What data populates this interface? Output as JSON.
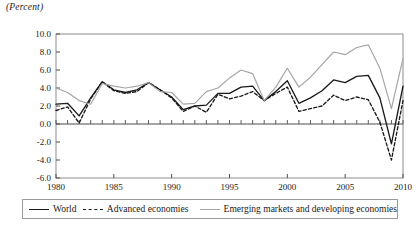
{
  "units_label": "(Percent)",
  "legend": {
    "entries": [
      {
        "label": "World",
        "style": "solid-dark",
        "color": "#1a1a1a"
      },
      {
        "label": "Advanced economies",
        "style": "dashed-dark",
        "color": "#1a1a1a"
      },
      {
        "label": "Emerging markets and developing economies",
        "style": "solid-gray",
        "color": "#a6a6a6"
      }
    ]
  },
  "chart_data": {
    "type": "line",
    "title": "",
    "subtitle": "",
    "xlabel": "",
    "ylabel": "(Percent)",
    "xlim": [
      1980,
      2010
    ],
    "ylim": [
      -6.0,
      10.0
    ],
    "yticks": [
      -6.0,
      -4.0,
      -2.0,
      0.0,
      2.0,
      4.0,
      6.0,
      8.0,
      10.0
    ],
    "ytick_labels": [
      "-6.0",
      "-4.0",
      "-2.0",
      "0.0",
      "2.0",
      "4.0",
      "6.0",
      "8.0",
      "10.0"
    ],
    "xticks": [
      1980,
      1985,
      1990,
      1995,
      2000,
      2005,
      2010
    ],
    "xtick_labels": [
      "1980",
      "1985",
      "1990",
      "1995",
      "2000",
      "2005",
      "2010"
    ],
    "minor_xticks_every": 1,
    "grid": false,
    "zero_line": true,
    "legend_position": "below",
    "x": [
      1980,
      1981,
      1982,
      1983,
      1984,
      1985,
      1986,
      1987,
      1988,
      1989,
      1990,
      1991,
      1992,
      1993,
      1994,
      1995,
      1996,
      1997,
      1998,
      1999,
      2000,
      2001,
      2002,
      2003,
      2004,
      2005,
      2006,
      2007,
      2008,
      2009,
      2010
    ],
    "series": [
      {
        "name": "World",
        "color": "#1a1a1a",
        "style": "solid",
        "values": [
          2.2,
          2.3,
          0.9,
          2.9,
          4.7,
          3.8,
          3.5,
          3.8,
          4.6,
          3.8,
          3.0,
          1.6,
          2.0,
          2.1,
          3.4,
          3.4,
          4.1,
          4.2,
          2.6,
          3.6,
          4.8,
          2.3,
          2.9,
          3.7,
          4.9,
          4.6,
          5.3,
          5.4,
          2.9,
          -2.2,
          4.2
        ]
      },
      {
        "name": "Advanced economies",
        "color": "#1a1a1a",
        "style": "dashed",
        "values": [
          1.5,
          1.9,
          0.1,
          2.8,
          4.7,
          3.7,
          3.4,
          3.6,
          4.6,
          3.8,
          2.9,
          1.4,
          2.0,
          1.3,
          3.3,
          2.8,
          3.1,
          3.6,
          2.6,
          3.4,
          4.1,
          1.4,
          1.7,
          2.0,
          3.2,
          2.6,
          3.0,
          2.7,
          0.2,
          -4.0,
          2.6
        ]
      },
      {
        "name": "Emerging markets and developing economies",
        "color": "#a6a6a6",
        "style": "solid",
        "values": [
          4.0,
          3.5,
          2.6,
          2.2,
          4.5,
          4.2,
          4.0,
          4.2,
          4.6,
          3.6,
          3.5,
          2.2,
          2.3,
          3.6,
          4.0,
          5.1,
          6.0,
          5.6,
          2.6,
          4.1,
          6.2,
          4.1,
          5.2,
          6.6,
          8.0,
          7.7,
          8.5,
          8.8,
          6.2,
          1.7,
          7.3
        ]
      }
    ]
  }
}
